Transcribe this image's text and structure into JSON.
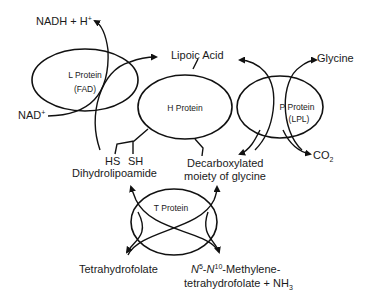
{
  "diagram": {
    "proteins": {
      "l": {
        "line1": "L Protein",
        "line2": "(FAD)"
      },
      "h": {
        "label": "H Protein"
      },
      "p": {
        "line1": "P Protein",
        "line2": "(LPL)"
      },
      "t": {
        "label": "T Protein"
      }
    },
    "labels": {
      "nadh": "NADH + H",
      "nadh_sup": "+",
      "nad": "NAD",
      "nad_sup": "+",
      "lipoic_acid": "Lipoic Acid",
      "glycine": "Glycine",
      "co2": "CO",
      "co2_sub": "2",
      "hs": "HS",
      "sh": "SH",
      "dihydrolipoamide": "Dihydrolipoamide",
      "decarboxylated_1": "Decarboxylated",
      "decarboxylated_2": "moiety of glycine",
      "tetrahydrofolate": "Tetrahydrofolate",
      "methylene_n5": "N",
      "methylene_5": "5",
      "methylene_dash": "-",
      "methylene_n10": "N",
      "methylene_10": "10",
      "methylene_rest": "-Methylene-",
      "methylene_line2": "tetrahydrofolate + NH",
      "methylene_nh3_sub": "3"
    }
  }
}
